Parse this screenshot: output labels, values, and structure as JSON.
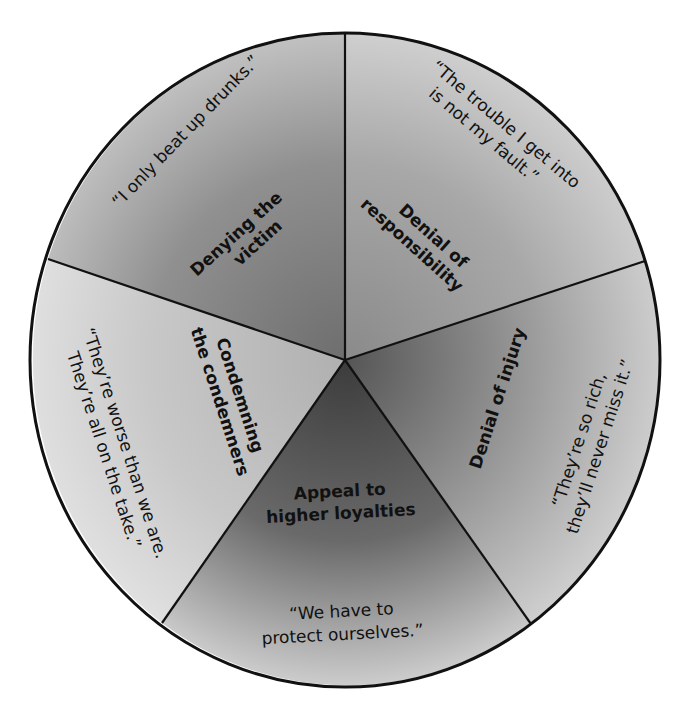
{
  "diagram": {
    "type": "segmented-wheel",
    "segments": [
      {
        "id": "denying-the-victim",
        "label_lines": [
          "Denying the",
          "victim"
        ],
        "quote_lines": [
          "“I only beat up drunks.”"
        ],
        "shade": "#8e8e8e"
      },
      {
        "id": "denial-of-responsibility",
        "label_lines": [
          "Denial of",
          "responsibility"
        ],
        "quote_lines": [
          "“The trouble I get into",
          "is not my fault.”"
        ],
        "shade": "#a4a4a4"
      },
      {
        "id": "denial-of-injury",
        "label_lines": [
          "Denial of injury"
        ],
        "quote_lines": [
          "“They’re so rich,",
          "they’ll never miss it.”"
        ],
        "shade": "#9a9a9a"
      },
      {
        "id": "appeal-to-higher-loyalties",
        "label_lines": [
          "Appeal to",
          "higher loyalties"
        ],
        "quote_lines": [
          "“We have to",
          "protect ourselves.”"
        ],
        "shade": "#5a5a5a"
      },
      {
        "id": "condemning-the-condemners",
        "label_lines": [
          "Condemning",
          "the condemners"
        ],
        "quote_lines": [
          "“They’re worse than we are.",
          "They’re all on the take.”"
        ],
        "shade": "#c4c4c4"
      }
    ],
    "colors": {
      "outline": "#111111",
      "background": "#ffffff"
    }
  }
}
